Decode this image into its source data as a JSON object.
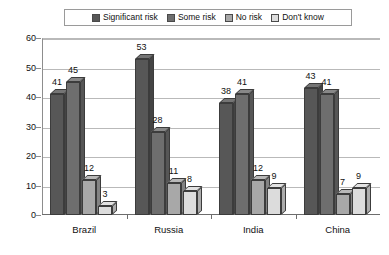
{
  "chart_data": {
    "type": "bar",
    "title": "",
    "subtitle": "",
    "xlabel": "",
    "ylabel": "",
    "categories": [
      "Brazil",
      "Russia",
      "India",
      "China"
    ],
    "series": [
      {
        "name": "Significant risk",
        "color": "#575757",
        "values": [
          41,
          53,
          38,
          43
        ]
      },
      {
        "name": "Some risk",
        "color": "#6e6e6e",
        "values": [
          45,
          28,
          41,
          41
        ]
      },
      {
        "name": "No risk",
        "color": "#a8a8a8",
        "values": [
          12,
          11,
          12,
          7
        ]
      },
      {
        "name": "Don't know",
        "color": "#dcdcdc",
        "values": [
          3,
          8,
          9,
          9
        ]
      }
    ],
    "ylim": [
      0,
      60
    ],
    "yticks": [
      0,
      10,
      20,
      30,
      40,
      50,
      60
    ],
    "ytick_labels": [
      "0",
      "10",
      "20",
      "30",
      "40",
      "50",
      "60"
    ],
    "grid": true,
    "grid_axis": "y",
    "legend_position": "top",
    "data_labels": true,
    "style": "3d-bar"
  },
  "legend": {
    "items": [
      {
        "label": "Significant risk"
      },
      {
        "label": "Some risk"
      },
      {
        "label": "No risk"
      },
      {
        "label": "Don't know"
      }
    ]
  }
}
